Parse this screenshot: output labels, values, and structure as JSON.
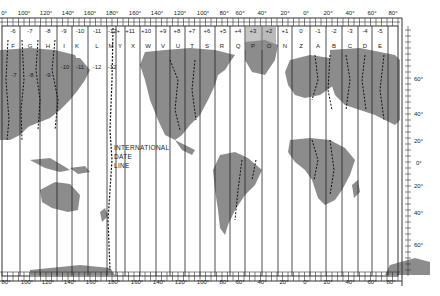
{
  "map": {
    "title": "World Time Zones",
    "projection": "Mercator",
    "colors": {
      "land": "#8c8c8c",
      "ocean": "#ffffff",
      "lines": "#222222",
      "frame": "#333333"
    },
    "top_longitude_labels": [
      "0°",
      "100°",
      "120°",
      "140°",
      "160°",
      "180°",
      "160°",
      "140°",
      "120°",
      "100°",
      "80°",
      "60°",
      "40°",
      "20°",
      "0°",
      "20°",
      "40°",
      "60°",
      "80°"
    ],
    "bottom_longitude_labels": [
      "80°",
      "100°",
      "120°",
      "140°",
      "160°",
      "180°",
      "160°",
      "140°",
      "120°",
      "100°",
      "80°",
      "60°",
      "40°",
      "20°",
      "0°",
      "20°",
      "40°",
      "60°",
      "80°"
    ],
    "zone_offsets": [
      "-6",
      "-7",
      "-8",
      "-9",
      "-10",
      "-11",
      "-12+",
      "+11",
      "+10",
      "+9",
      "+8",
      "+7",
      "+6",
      "+5",
      "+4",
      "+3",
      "+2",
      "+1",
      "0",
      "-1",
      "-2",
      "-3",
      "-4",
      "-5"
    ],
    "zone_letters": [
      "F",
      "G",
      "H",
      "I",
      "K",
      "L",
      "M",
      "Y",
      "X",
      "W",
      "V",
      "U",
      "T",
      "S",
      "R",
      "Q",
      "P",
      "O",
      "N",
      "Z",
      "A",
      "B",
      "C",
      "D",
      "E"
    ],
    "inner_zone_labels": [
      "-7",
      "-8",
      "-9",
      "-10",
      "-11",
      "-12",
      "-12"
    ],
    "latitude_labels": [
      "60°",
      "40°",
      "20°",
      "0°",
      "20°",
      "40°",
      "60°"
    ],
    "date_line_label": {
      "line1": "INTERNATIONAL",
      "line2": "DATE",
      "line3": "LINE"
    }
  }
}
